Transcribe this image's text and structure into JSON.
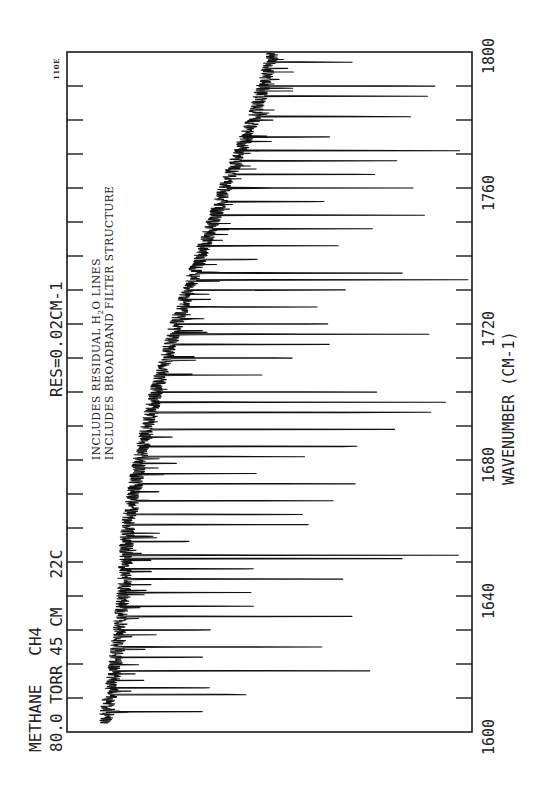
{
  "chart_data": {
    "type": "line",
    "title": "METHANE CH4",
    "subtitle": "80.0 TORR 45 CM 22C",
    "resolution": "RES=0.02CM-1",
    "xlabel": "WAVENUMBER (CM-1)",
    "ylabel": "",
    "xlim": [
      1600,
      1800
    ],
    "x_ticks_major": [
      1600,
      1640,
      1680,
      1720,
      1760,
      1800
    ],
    "x_tick_labels": [
      "1600",
      "1640",
      "1680",
      "1720",
      "1760",
      "1800"
    ],
    "x_ticks_minor_spacing": 10,
    "grid": false,
    "orientation": "rotated 90deg (wavenumber runs bottom-to-top, transmittance decreases rightward)",
    "annotations": [
      "INCLUDES RESIDUAL H2O LINES",
      "INCLUDES BROADBAND FILTER STRUCTURE",
      "110E"
    ],
    "baseline": {
      "description": "Transmission baseline rises from low position at 1600 to a maximum near 1650-1660, then declines steadily toward 1800",
      "x": [
        1600,
        1620,
        1640,
        1660,
        1680,
        1700,
        1720,
        1740,
        1760,
        1780,
        1800
      ],
      "relative_level": [
        0.03,
        0.06,
        0.08,
        0.09,
        0.12,
        0.16,
        0.21,
        0.27,
        0.33,
        0.4,
        0.45
      ]
    },
    "absorption_lines": {
      "description": "Approximate positions and relative depths (0 = baseline, 1 = full frame width) of strongest absorption lines",
      "x": [
        1606,
        1611,
        1613,
        1618,
        1622,
        1625,
        1630,
        1634,
        1637,
        1641,
        1645,
        1648,
        1651,
        1652,
        1656,
        1661,
        1664,
        1668,
        1673,
        1676,
        1681,
        1684,
        1689,
        1694,
        1697,
        1700,
        1705,
        1710,
        1714,
        1717,
        1720,
        1725,
        1730,
        1733,
        1735,
        1739,
        1743,
        1748,
        1752,
        1756,
        1760,
        1764,
        1768,
        1771,
        1775,
        1781,
        1787,
        1790,
        1797
      ],
      "depth": [
        0.27,
        0.55,
        0.35,
        0.8,
        0.3,
        0.52,
        0.33,
        0.6,
        0.45,
        0.4,
        0.7,
        0.52,
        0.78,
        0.87,
        0.25,
        0.48,
        0.6,
        0.63,
        0.78,
        0.4,
        0.5,
        0.86,
        0.7,
        0.98,
        0.75,
        0.78,
        0.3,
        0.48,
        0.45,
        0.8,
        0.6,
        0.4,
        0.55,
        0.77,
        0.64,
        0.2,
        0.38,
        0.56,
        0.6,
        0.42,
        0.5,
        0.58,
        0.45,
        0.7,
        0.3,
        0.5,
        0.42,
        0.6,
        0.25
      ]
    }
  },
  "labels": {
    "info_line1": "METHANE   CH4",
    "info_line2": "80.0 TORR 45 CM   22C",
    "resolution": "RES=0.02CM-1",
    "note_line1_pre": "INCLUDES RESIDUAL H",
    "note_line1_sub": "2",
    "note_line1_post": "O LINES",
    "note_line2": "INCLUDES BROADBAND FILTER STRUCTURE",
    "corner_code": "110E",
    "x_axis_title": "WAVENUMBER (CM-1)",
    "tick_1600": "1600",
    "tick_1640": "1640",
    "tick_1680": "1680",
    "tick_1720": "1720",
    "tick_1760": "1760",
    "tick_1800": "1800"
  },
  "style": {
    "ink_color": "#111111",
    "paper_color": "#ffffff"
  }
}
